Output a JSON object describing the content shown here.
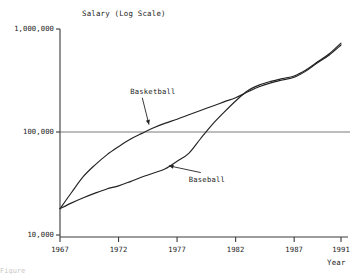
{
  "chart_data": {
    "type": "line",
    "title": "",
    "ylabel": "Salary (Log Scale)",
    "xlabel": "Year",
    "log_scale": true,
    "grid": false,
    "legend_position": "inline-annotations",
    "xlim": [
      1967,
      1991
    ],
    "ylim": [
      10000,
      1000000
    ],
    "ytick_labels": [
      "1,000,000",
      "100,000",
      "10,000"
    ],
    "ytick_values": [
      1000000,
      100000,
      10000
    ],
    "xtick_labels": [
      "1967",
      "1972",
      "1977",
      "1982",
      "1987",
      "1991"
    ],
    "xtick_values": [
      1967,
      1972,
      1977,
      1982,
      1987,
      1991
    ],
    "reference_line": {
      "value": 100000,
      "label": "100,000"
    },
    "x": [
      1967,
      1968,
      1969,
      1970,
      1971,
      1972,
      1973,
      1974,
      1975,
      1976,
      1977,
      1978,
      1979,
      1980,
      1981,
      1982,
      1983,
      1984,
      1985,
      1986,
      1987,
      1988,
      1989,
      1990,
      1991
    ],
    "series": [
      {
        "name": "Basketball",
        "label": "Basketball",
        "values": [
          18000,
          26000,
          37000,
          48000,
          60000,
          72000,
          85000,
          97000,
          110000,
          122000,
          133000,
          147000,
          162000,
          178000,
          196000,
          215000,
          244000,
          275000,
          300000,
          320000,
          340000,
          390000,
          470000,
          560000,
          700000
        ],
        "annotation": {
          "text": "Basketball",
          "text_x": 1973.0,
          "text_y": 235000,
          "arrow_to_x": 1974.6,
          "arrow_to_y": 118000
        }
      },
      {
        "name": "Baseball",
        "label": "Baseball",
        "values": [
          18000,
          20500,
          23000,
          25500,
          28000,
          30000,
          33000,
          36500,
          40000,
          44000,
          52000,
          62000,
          86000,
          118000,
          155000,
          200000,
          250000,
          285000,
          310000,
          330000,
          350000,
          400000,
          480000,
          575000,
          730000
        ],
        "annotation": {
          "text": "Baseball",
          "text_x": 1978.0,
          "text_y": 33000,
          "arrow_to_x": 1976.3,
          "arrow_to_y": 47000
        }
      }
    ]
  },
  "figure": {
    "caption_fragment": "Figure"
  }
}
